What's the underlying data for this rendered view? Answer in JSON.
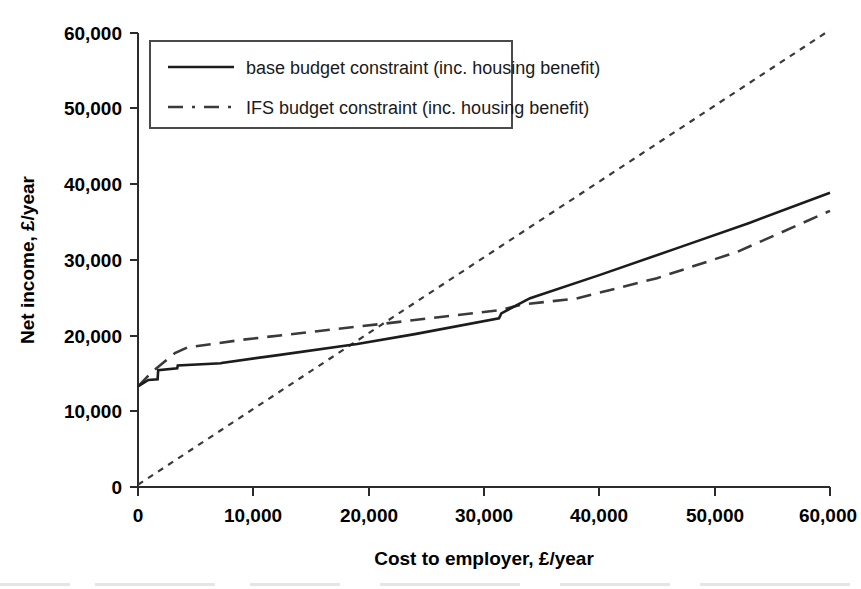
{
  "chart_data": {
    "type": "line",
    "title": "",
    "xlabel": "Cost to employer, £/year",
    "ylabel": "Net income, £/year",
    "xlim": [
      0,
      60000
    ],
    "ylim": [
      0,
      60000
    ],
    "grid": false,
    "legend_position": "top-left",
    "xticks": [
      0,
      10000,
      20000,
      30000,
      40000,
      50000,
      60000
    ],
    "yticks": [
      0,
      10000,
      20000,
      30000,
      40000,
      50000,
      60000
    ],
    "xtick_labels": [
      "0",
      "10,000",
      "20,000",
      "30,000",
      "40,000",
      "50,000",
      "60,000"
    ],
    "ytick_labels": [
      "0",
      "10,000",
      "20,000",
      "30,000",
      "40,000",
      "50,000",
      "60,000"
    ],
    "series": [
      {
        "name": "base budget constraint (inc. housing benefit)",
        "style": "solid",
        "color": "#1c1c1c",
        "x": [
          0,
          900,
          1700,
          1750,
          3400,
          3450,
          7200,
          7250,
          12000,
          19000,
          24000,
          31300,
          31500,
          34000,
          40000,
          47000,
          53000,
          60000
        ],
        "y": [
          13300,
          14150,
          14250,
          15450,
          15700,
          16050,
          16350,
          16400,
          17400,
          18900,
          20200,
          22300,
          22950,
          24950,
          28000,
          31700,
          34900,
          38900
        ]
      },
      {
        "name": "IFS budget constraint (inc. housing benefit)",
        "style": "dashed",
        "color": "#3a3a3a",
        "x": [
          0,
          1200,
          3200,
          4300,
          9000,
          15000,
          21400,
          27000,
          31500,
          33200,
          38000,
          45000,
          52000,
          60000
        ],
        "y": [
          13300,
          15200,
          17700,
          18450,
          19450,
          20500,
          21600,
          22600,
          23400,
          24100,
          24900,
          27600,
          31100,
          36500
        ]
      },
      {
        "name": "45-degree reference line",
        "style": "dotted",
        "color": "#3a3a3a",
        "x": [
          0,
          60000
        ],
        "y": [
          300,
          60400
        ]
      }
    ],
    "annotations": {
      "base_crosses_reference_at": 19000,
      "ifs_crosses_reference_at": 21400,
      "base_crosses_ifs_at": 33500
    }
  },
  "legend": {
    "items": [
      {
        "label": "base budget constraint (inc. housing benefit)",
        "style": "solid",
        "swatch_name": "legend-swatch-solid"
      },
      {
        "label": "IFS budget constraint (inc. housing benefit)",
        "style": "dashed",
        "swatch_name": "legend-swatch-dashed"
      }
    ]
  },
  "colors": {
    "background": "#ffffff",
    "axis": "#2b2b2b",
    "base_series": "#1c1c1c",
    "ifs_series": "#3a3a3a",
    "reference_series": "#3a3a3a",
    "text": "#000000"
  }
}
